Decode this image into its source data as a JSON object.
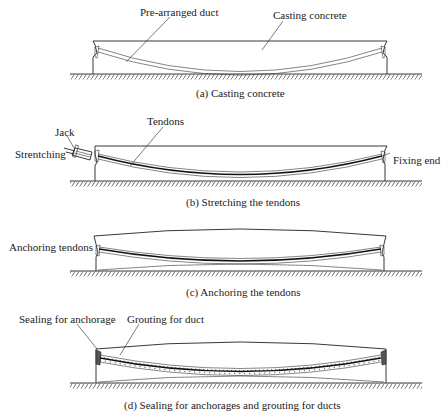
{
  "figure": {
    "panels": [
      {
        "id": "a",
        "caption": "(a) Casting concrete",
        "labels": {
          "duct": "Pre-arranged duct",
          "concrete": "Casting concrete"
        }
      },
      {
        "id": "b",
        "caption": "(b) Stretching the tendons",
        "labels": {
          "jack": "Jack",
          "stretching": "Strentching",
          "tendons": "Tendons",
          "fixing_end": "Fixing end"
        }
      },
      {
        "id": "c",
        "caption": "(c) Anchoring the tendons",
        "labels": {
          "anchoring": "Anchoring tendons"
        }
      },
      {
        "id": "d",
        "caption": "(d) Sealing for anchorages and grouting for ducts",
        "labels": {
          "sealing": "Sealing for anchorage",
          "grouting": "Grouting for duct"
        }
      }
    ],
    "colors": {
      "line": "#222222",
      "background": "#ffffff"
    }
  }
}
